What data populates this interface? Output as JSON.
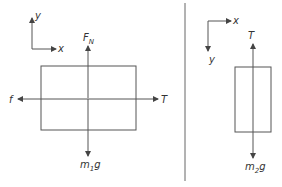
{
  "diagram": {
    "type": "free-body-diagrams",
    "left_panel": {
      "axes": {
        "x_label": "x",
        "y_label": "y",
        "x_direction": "right",
        "y_direction": "up"
      },
      "body": "block m1",
      "forces": [
        {
          "label": "F",
          "subscript": "N",
          "direction": "up"
        },
        {
          "label": "f",
          "subscript": "",
          "direction": "left"
        },
        {
          "label": "T",
          "subscript": "",
          "direction": "right"
        },
        {
          "label": "m",
          "subscript": "1",
          "suffix": "g",
          "direction": "down"
        }
      ]
    },
    "right_panel": {
      "axes": {
        "x_label": "x",
        "y_label": "y",
        "x_direction": "right",
        "y_direction": "down"
      },
      "body": "block m2",
      "forces": [
        {
          "label": "T",
          "subscript": "",
          "direction": "up"
        },
        {
          "label": "m",
          "subscript": "2",
          "suffix": "g",
          "direction": "down"
        }
      ]
    },
    "colors": {
      "line": "#555555",
      "text": "#333333",
      "background": "#ffffff"
    }
  }
}
